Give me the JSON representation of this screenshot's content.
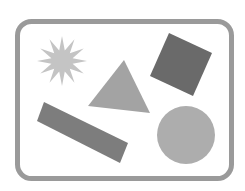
{
  "canvas": {
    "width": 245,
    "height": 191,
    "background": "#ffffff"
  },
  "frame": {
    "x": 17.5,
    "y": 21.5,
    "width": 214,
    "height": 157,
    "rx": 14,
    "stroke": "#9a9a9a",
    "stroke_width": 5,
    "fill": "#ffffff"
  },
  "shapes": {
    "star": {
      "label": "star",
      "cx": 62,
      "cy": 61,
      "points": 12,
      "outer_r": 25,
      "inner_r": 11,
      "fill": "#c4c4c4"
    },
    "triangle": {
      "label": "triangle",
      "points": "124,60 88,106 150,113",
      "fill": "#a3a3a3"
    },
    "square": {
      "label": "square",
      "points": "169,33 212,53 193,96 150,76",
      "fill": "#6a6a6a"
    },
    "rectangle": {
      "label": "rectangle",
      "points": "44,102 128,143 120,163 37,121",
      "fill": "#7d7d7d"
    },
    "circle": {
      "label": "circle",
      "cx": 186,
      "cy": 135,
      "r": 29,
      "fill": "#adadad"
    }
  }
}
